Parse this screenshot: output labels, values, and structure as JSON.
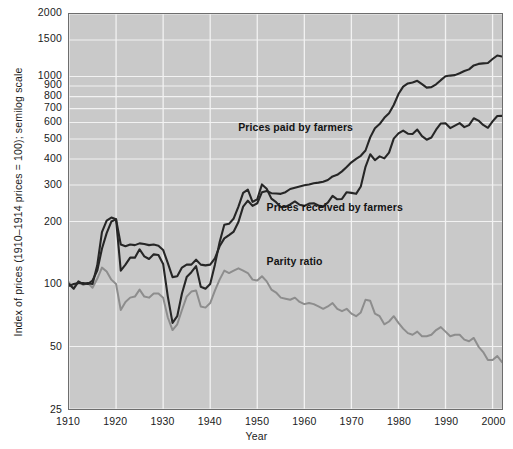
{
  "chart_data": {
    "type": "line",
    "title": "",
    "xlabel": "Year",
    "ylabel": "Index of prices (1910–1914 prices = 100); semilog scale",
    "scale": "semilog",
    "grid": true,
    "legend_position": "inline-annotations",
    "background_color": "#c9c9c9",
    "xlim": [
      1910,
      2002
    ],
    "ylim": [
      25,
      2000
    ],
    "xticks": [
      "1910",
      "1920",
      "1930",
      "1940",
      "1950",
      "1960",
      "1970",
      "1980",
      "1990",
      "2000"
    ],
    "xtick_values": [
      1910,
      1920,
      1930,
      1940,
      1950,
      1960,
      1970,
      1980,
      1990,
      2000
    ],
    "yticks": [
      "2000",
      "1500",
      "1000",
      "900",
      "800",
      "700",
      "600",
      "500",
      "400",
      "300",
      "200",
      "100",
      "50",
      "25"
    ],
    "ytick_values": [
      2000,
      1500,
      1000,
      900,
      800,
      700,
      600,
      500,
      400,
      300,
      200,
      100,
      50,
      25
    ],
    "series": [
      {
        "name": "Prices paid by farmers",
        "color": "#262626",
        "label_x": 1946,
        "label_y": 560,
        "x": [
          1910,
          1911,
          1912,
          1913,
          1914,
          1915,
          1916,
          1917,
          1918,
          1919,
          1920,
          1921,
          1922,
          1923,
          1924,
          1925,
          1926,
          1927,
          1928,
          1929,
          1930,
          1931,
          1932,
          1933,
          1934,
          1935,
          1936,
          1937,
          1938,
          1939,
          1940,
          1941,
          1942,
          1943,
          1944,
          1945,
          1946,
          1947,
          1948,
          1949,
          1950,
          1951,
          1952,
          1953,
          1954,
          1955,
          1956,
          1957,
          1958,
          1959,
          1960,
          1961,
          1962,
          1963,
          1964,
          1965,
          1966,
          1967,
          1968,
          1969,
          1970,
          1971,
          1972,
          1973,
          1974,
          1975,
          1976,
          1977,
          1978,
          1979,
          1980,
          1981,
          1982,
          1983,
          1984,
          1985,
          1986,
          1987,
          1988,
          1989,
          1990,
          1991,
          1992,
          1993,
          1994,
          1995,
          1996,
          1997,
          1998,
          1999,
          2000,
          2001,
          2002
        ],
        "y": [
          98,
          100,
          101,
          101,
          100,
          104,
          116,
          148,
          176,
          200,
          205,
          155,
          152,
          155,
          154,
          157,
          156,
          154,
          155,
          153,
          146,
          126,
          108,
          109,
          120,
          124,
          124,
          131,
          124,
          123,
          124,
          133,
          152,
          166,
          172,
          179,
          199,
          236,
          252,
          238,
          245,
          277,
          281,
          274,
          273,
          272,
          277,
          287,
          291,
          295,
          299,
          302,
          306,
          308,
          311,
          317,
          330,
          336,
          349,
          366,
          386,
          401,
          415,
          440,
          509,
          563,
          590,
          632,
          665,
          729,
          823,
          894,
          926,
          936,
          953,
          919,
          884,
          889,
          917,
          960,
          1002,
          1010,
          1015,
          1037,
          1062,
          1082,
          1131,
          1150,
          1156,
          1162,
          1214,
          1262,
          1248
        ],
        "annotations": []
      },
      {
        "name": "Prices received by farmers",
        "color": "#262626",
        "label_x": 1952,
        "label_y": 232,
        "x": [
          1910,
          1911,
          1912,
          1913,
          1914,
          1915,
          1916,
          1917,
          1918,
          1919,
          1920,
          1921,
          1922,
          1923,
          1924,
          1925,
          1926,
          1927,
          1928,
          1929,
          1930,
          1931,
          1932,
          1933,
          1934,
          1935,
          1936,
          1937,
          1938,
          1939,
          1940,
          1941,
          1942,
          1943,
          1944,
          1945,
          1946,
          1947,
          1948,
          1949,
          1950,
          1951,
          1952,
          1953,
          1954,
          1955,
          1956,
          1957,
          1958,
          1959,
          1960,
          1961,
          1962,
          1963,
          1964,
          1965,
          1966,
          1967,
          1968,
          1969,
          1970,
          1971,
          1972,
          1973,
          1974,
          1975,
          1976,
          1977,
          1978,
          1979,
          1980,
          1981,
          1982,
          1983,
          1984,
          1985,
          1986,
          1987,
          1988,
          1989,
          1990,
          1991,
          1992,
          1993,
          1994,
          1995,
          1996,
          1997,
          1998,
          1999,
          2000,
          2001,
          2002
        ],
        "y": [
          100,
          95,
          103,
          100,
          101,
          100,
          123,
          178,
          202,
          209,
          205,
          116,
          124,
          134,
          134,
          147,
          136,
          132,
          139,
          138,
          125,
          87,
          65,
          70,
          90,
          108,
          114,
          122,
          97,
          95,
          100,
          124,
          159,
          193,
          195,
          207,
          236,
          275,
          285,
          249,
          256,
          302,
          288,
          258,
          248,
          235,
          235,
          242,
          250,
          241,
          238,
          244,
          245,
          239,
          236,
          247,
          266,
          256,
          257,
          277,
          275,
          272,
          295,
          367,
          422,
          395,
          412,
          403,
          430,
          502,
          532,
          549,
          530,
          528,
          555,
          516,
          496,
          508,
          554,
          594,
          595,
          564,
          580,
          596,
          570,
          583,
          629,
          613,
          584,
          566,
          608,
          645,
          646
        ],
        "annotations": []
      },
      {
        "name": "Parity ratio",
        "color": "#8d8d8d",
        "label_x": 1952,
        "label_y": 128,
        "x": [
          1910,
          1911,
          1912,
          1913,
          1914,
          1915,
          1916,
          1917,
          1918,
          1919,
          1920,
          1921,
          1922,
          1923,
          1924,
          1925,
          1926,
          1927,
          1928,
          1929,
          1930,
          1931,
          1932,
          1933,
          1934,
          1935,
          1936,
          1937,
          1938,
          1939,
          1940,
          1941,
          1942,
          1943,
          1944,
          1945,
          1946,
          1947,
          1948,
          1949,
          1950,
          1951,
          1952,
          1953,
          1954,
          1955,
          1956,
          1957,
          1958,
          1959,
          1960,
          1961,
          1962,
          1963,
          1964,
          1965,
          1966,
          1967,
          1968,
          1969,
          1970,
          1971,
          1972,
          1973,
          1974,
          1975,
          1976,
          1977,
          1978,
          1979,
          1980,
          1981,
          1982,
          1983,
          1984,
          1985,
          1986,
          1987,
          1988,
          1989,
          1990,
          1991,
          1992,
          1993,
          1994,
          1995,
          1996,
          1997,
          1998,
          1999,
          2000,
          2001,
          2002
        ],
        "y": [
          102,
          95,
          102,
          99,
          101,
          96,
          106,
          120,
          115,
          105,
          100,
          75,
          82,
          86,
          87,
          94,
          87,
          86,
          90,
          90,
          86,
          69,
          60,
          64,
          75,
          87,
          92,
          93,
          78,
          77,
          81,
          93,
          105,
          116,
          113,
          116,
          119,
          116,
          113,
          105,
          104,
          109,
          103,
          94,
          91,
          86,
          85,
          84,
          86,
          82,
          80,
          81,
          80,
          78,
          76,
          78,
          81,
          76,
          74,
          76,
          72,
          70,
          73,
          84,
          83,
          72,
          70,
          64,
          66,
          70,
          65,
          61,
          58,
          57,
          59,
          56,
          56,
          57,
          60,
          62,
          59,
          56,
          57,
          57,
          54,
          53,
          55,
          50,
          47,
          43,
          43,
          45,
          42
        ],
        "annotations": []
      }
    ]
  },
  "axes": {
    "x_title": "Year",
    "y_title": "Index of prices (1910–1914 prices = 100); semilog scale"
  },
  "colors": {
    "plot_background": "#c9c9c9",
    "gridline": "#f2f2f2",
    "border": "#6d6d6d",
    "dark_series": "#262626",
    "gray_series": "#8d8d8d",
    "text": "#1b1b1b"
  }
}
